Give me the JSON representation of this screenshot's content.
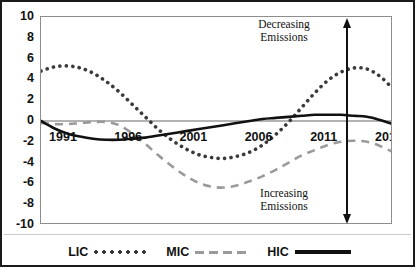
{
  "chart_data": {
    "type": "line",
    "title": "",
    "xlabel": "",
    "ylabel": "",
    "xlim": [
      1991,
      2018
    ],
    "ylim": [
      -10,
      10
    ],
    "grid": false,
    "legend_position": "bottom-center",
    "x_tick_labels": [
      "1991",
      "1996",
      "2001",
      "2006",
      "2011",
      "2016"
    ],
    "x_tick_values": [
      1991,
      1996,
      2001,
      2006,
      2011,
      2016
    ],
    "y_tick_labels": [
      "10",
      "8",
      "6",
      "4",
      "2",
      "0",
      "-2",
      "-4",
      "-6",
      "-8",
      "-10"
    ],
    "y_tick_values": [
      10,
      8,
      6,
      4,
      2,
      0,
      -2,
      -4,
      -6,
      -8,
      -10
    ],
    "x": [
      1991,
      1992,
      1993,
      1994,
      1995,
      1996,
      1997,
      1998,
      1999,
      2000,
      2001,
      2002,
      2003,
      2004,
      2005,
      2006,
      2007,
      2008,
      2009,
      2010,
      2011,
      2012,
      2013,
      2014,
      2015,
      2016,
      2017,
      2018
    ],
    "series": [
      {
        "name": "LIC",
        "style": "dotted",
        "color": "#3a3a3a",
        "values": [
          4.8,
          5.2,
          5.3,
          5.1,
          4.6,
          3.8,
          2.8,
          1.6,
          0.4,
          -0.8,
          -1.8,
          -2.6,
          -3.2,
          -3.5,
          -3.6,
          -3.4,
          -3.0,
          -2.3,
          -1.3,
          -0.1,
          1.3,
          2.7,
          3.9,
          4.7,
          5.1,
          5.0,
          4.3,
          3.1
        ]
      },
      {
        "name": "MIC",
        "style": "dashed",
        "color": "#9a9a9a",
        "values": [
          -0.2,
          -0.3,
          -0.3,
          -0.2,
          -0.1,
          -0.1,
          -0.4,
          -1.2,
          -2.2,
          -3.3,
          -4.3,
          -5.2,
          -5.9,
          -6.3,
          -6.4,
          -6.2,
          -5.8,
          -5.3,
          -4.7,
          -4.0,
          -3.3,
          -2.8,
          -2.3,
          -2.0,
          -1.9,
          -2.0,
          -2.4,
          -3.0
        ]
      },
      {
        "name": "HIC",
        "style": "solid",
        "color": "#111111",
        "values": [
          0.0,
          -0.7,
          -1.2,
          -1.5,
          -1.7,
          -1.8,
          -1.8,
          -1.7,
          -1.6,
          -1.4,
          -1.2,
          -1.0,
          -0.8,
          -0.6,
          -0.4,
          -0.2,
          0.0,
          0.2,
          0.3,
          0.4,
          0.5,
          0.6,
          0.6,
          0.6,
          0.5,
          0.4,
          0.1,
          -0.3
        ]
      }
    ],
    "annotations": [
      {
        "id": "decreasing",
        "text": "Decreasing\nEmissions",
        "arrow": "up"
      },
      {
        "id": "increasing",
        "text": "Increasing\nEmissions",
        "arrow": "down"
      }
    ],
    "legend_entries": [
      {
        "label": "LIC",
        "style": "dotted"
      },
      {
        "label": "MIC",
        "style": "dashed"
      },
      {
        "label": "HIC",
        "style": "solid"
      }
    ]
  },
  "colors": {
    "frame": "#1a1a1a",
    "plot_border": "#8d8d8d",
    "zero_line": "#9a9a9a",
    "lic": "#3a3a3a",
    "mic": "#9a9a9a",
    "hic": "#111111",
    "background": "#ffffff"
  }
}
